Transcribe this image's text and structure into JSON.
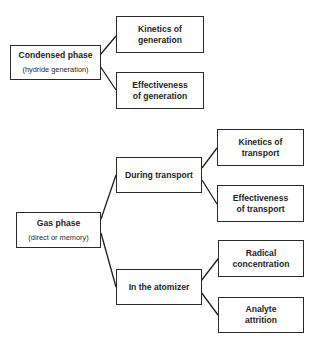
{
  "diagram": {
    "nodes": {
      "condensed": {
        "title": "Condensed phase",
        "subtitle": "(hydride generation)"
      },
      "kin_gen": {
        "line1": "Kinetics of",
        "line2": "generation"
      },
      "eff_gen": {
        "line1": "Effectiveness",
        "line2": "of generation"
      },
      "gas": {
        "title": "Gas phase",
        "subtitle": "(direct or memory)"
      },
      "transport": {
        "title": "During transport"
      },
      "kin_tr": {
        "line1": "Kinetics of",
        "line2": "transport"
      },
      "eff_tr": {
        "line1": "Effectiveness",
        "line2": "of transport"
      },
      "atomizer": {
        "title": "In the atomizer"
      },
      "radical": {
        "line1": "Radical",
        "line2": "concentration"
      },
      "attrition": {
        "line1": "Analyte",
        "line2": "attrition"
      }
    },
    "edges": [
      [
        "condensed",
        "kin_gen"
      ],
      [
        "condensed",
        "eff_gen"
      ],
      [
        "gas",
        "transport"
      ],
      [
        "gas",
        "atomizer"
      ],
      [
        "transport",
        "kin_tr"
      ],
      [
        "transport",
        "eff_tr"
      ],
      [
        "atomizer",
        "radical"
      ],
      [
        "atomizer",
        "attrition"
      ]
    ],
    "colors": {
      "stroke": "#2a2a2a",
      "text": "#1e1e1e",
      "background": "#ffffff"
    }
  }
}
